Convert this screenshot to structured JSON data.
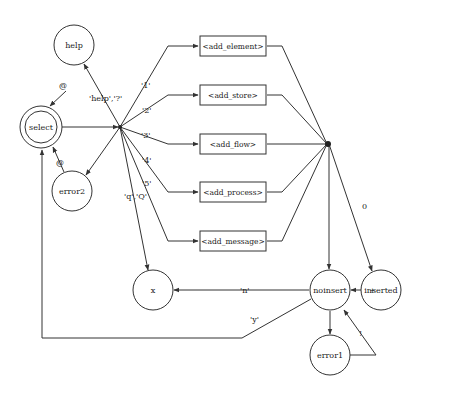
{
  "colors": {
    "stroke": "#333333",
    "text": "#222222",
    "background": "#ffffff"
  },
  "states": {
    "help": "help",
    "select": "select",
    "error2": "error2",
    "x": "x",
    "noinsert": "noinsert",
    "inserted": "inserted",
    "error1": "error1"
  },
  "actions": [
    {
      "id": "add_element",
      "label": "<add_element>"
    },
    {
      "id": "add_store",
      "label": "<add_store>"
    },
    {
      "id": "add_flow",
      "label": "<add_flow>"
    },
    {
      "id": "add_process",
      "label": "<add_process>"
    },
    {
      "id": "add_message",
      "label": "<add_message>"
    }
  ],
  "edge_labels": {
    "help_to_select": "@",
    "error2_to_select": "@",
    "to_help": "'help','?'",
    "opt1": "'1'",
    "opt2": "'2'",
    "opt3": "'3'",
    "opt4": "'4'",
    "opt5": "'5'",
    "quit": "'q','Q'",
    "zero": "0",
    "plus": "+",
    "no": "'n'",
    "yes": "'y'",
    "bang": "!"
  }
}
